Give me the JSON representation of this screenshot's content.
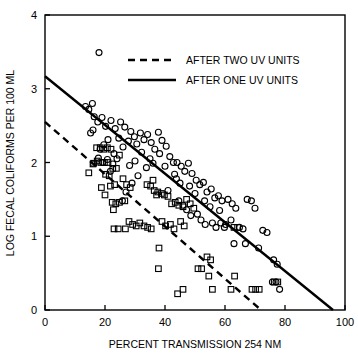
{
  "chart_data": {
    "type": "scatter",
    "title": "",
    "xlabel": "PERCENT TRANSMISSION 254 NM",
    "ylabel": "LOG FECAL COLIFORMS PER 100 ML",
    "xlim": [
      0,
      100
    ],
    "ylim": [
      0,
      4
    ],
    "xticks": [
      0,
      20,
      40,
      60,
      80,
      100
    ],
    "yticks": [
      0,
      1,
      2,
      3,
      4
    ],
    "xtick_labels": [
      "0",
      "20",
      "40",
      "60",
      "80",
      "100"
    ],
    "ytick_labels": [
      "0",
      "1",
      "2",
      "3",
      "4"
    ],
    "grid": false,
    "legend_position": "top-center",
    "series": [
      {
        "name": "AFTER ONE UV UNITS",
        "marker": "circle",
        "points": [
          [
            18.0,
            3.49
          ],
          [
            13.5,
            2.76
          ],
          [
            14.6,
            2.72
          ],
          [
            15.8,
            2.8
          ],
          [
            16.4,
            2.62
          ],
          [
            15.2,
            2.4
          ],
          [
            16.0,
            2.44
          ],
          [
            17.6,
            2.55
          ],
          [
            19.0,
            2.61
          ],
          [
            20.2,
            2.49
          ],
          [
            21.0,
            2.31
          ],
          [
            19.6,
            2.24
          ],
          [
            18.4,
            2.18
          ],
          [
            22.0,
            2.57
          ],
          [
            23.4,
            2.46
          ],
          [
            24.6,
            2.33
          ],
          [
            23.0,
            2.12
          ],
          [
            25.2,
            2.55
          ],
          [
            26.6,
            2.48
          ],
          [
            27.8,
            2.29
          ],
          [
            26.0,
            2.21
          ],
          [
            24.0,
            2.05
          ],
          [
            22.6,
            1.98
          ],
          [
            28.6,
            2.42
          ],
          [
            29.8,
            2.35
          ],
          [
            30.6,
            2.25
          ],
          [
            31.8,
            2.4
          ],
          [
            33.0,
            2.31
          ],
          [
            32.2,
            2.14
          ],
          [
            30.0,
            2.02
          ],
          [
            28.2,
            1.96
          ],
          [
            34.2,
            2.38
          ],
          [
            35.4,
            2.27
          ],
          [
            36.6,
            2.18
          ],
          [
            35.0,
            2.05
          ],
          [
            33.8,
            1.93
          ],
          [
            37.8,
            2.41
          ],
          [
            39.0,
            2.3
          ],
          [
            38.2,
            2.12
          ],
          [
            36.0,
            1.99
          ],
          [
            40.4,
            2.22
          ],
          [
            41.6,
            2.08
          ],
          [
            40.0,
            1.95
          ],
          [
            42.8,
            2.0
          ],
          [
            44.0,
            2.0
          ],
          [
            43.2,
            1.84
          ],
          [
            45.4,
            1.95
          ],
          [
            46.6,
            1.88
          ],
          [
            45.0,
            1.72
          ],
          [
            47.8,
            1.99
          ],
          [
            49.0,
            1.85
          ],
          [
            48.2,
            1.68
          ],
          [
            50.4,
            1.76
          ],
          [
            51.6,
            1.7
          ],
          [
            50.0,
            1.58
          ],
          [
            52.8,
            1.73
          ],
          [
            54.0,
            1.6
          ],
          [
            53.2,
            1.48
          ],
          [
            55.4,
            1.64
          ],
          [
            56.6,
            1.52
          ],
          [
            55.0,
            1.4
          ],
          [
            57.8,
            1.55
          ],
          [
            59.0,
            1.48
          ],
          [
            58.2,
            1.35
          ],
          [
            61.0,
            1.5
          ],
          [
            62.4,
            1.44
          ],
          [
            63.6,
            1.38
          ],
          [
            62.0,
            1.22
          ],
          [
            60.2,
            1.16
          ],
          [
            44.6,
            1.48
          ],
          [
            46.0,
            1.42
          ],
          [
            47.2,
            1.36
          ],
          [
            48.6,
            1.28
          ],
          [
            50.8,
            1.3
          ],
          [
            52.0,
            1.22
          ],
          [
            53.4,
            1.16
          ],
          [
            55.8,
            1.18
          ],
          [
            57.0,
            1.12
          ],
          [
            58.6,
            1.18
          ],
          [
            59.8,
            1.12
          ],
          [
            64.8,
            1.12
          ],
          [
            66.0,
            1.1
          ],
          [
            67.4,
            1.5
          ],
          [
            68.8,
            1.48
          ],
          [
            70.0,
            1.38
          ],
          [
            66.8,
            0.9
          ],
          [
            63.0,
            0.9
          ],
          [
            71.2,
            0.84
          ],
          [
            72.6,
            1.08
          ],
          [
            74.0,
            1.05
          ],
          [
            76.2,
            0.68
          ],
          [
            77.4,
            0.62
          ],
          [
            75.8,
            0.38
          ],
          [
            77.0,
            0.38
          ],
          [
            78.2,
            0.28
          ],
          [
            41.0,
            1.62
          ],
          [
            43.8,
            1.78
          ],
          [
            31.0,
            1.82
          ],
          [
            29.0,
            1.72
          ],
          [
            27.0,
            1.6
          ],
          [
            25.8,
            1.48
          ],
          [
            21.8,
            1.88
          ],
          [
            20.8,
            2.04
          ],
          [
            19.2,
            2.0
          ],
          [
            17.8,
            2.06
          ]
        ]
      },
      {
        "name": "AFTER TWO UV UNITS",
        "marker": "square",
        "points": [
          [
            14.6,
            1.86
          ],
          [
            16.0,
            1.98
          ],
          [
            17.2,
            2.2
          ],
          [
            18.4,
            2.2
          ],
          [
            19.6,
            2.18
          ],
          [
            20.8,
            2.2
          ],
          [
            22.0,
            2.18
          ],
          [
            21.0,
            2.0
          ],
          [
            19.8,
            2.0
          ],
          [
            18.6,
            2.0
          ],
          [
            17.4,
            2.02
          ],
          [
            16.2,
            1.99
          ],
          [
            20.2,
            1.84
          ],
          [
            21.4,
            1.82
          ],
          [
            22.6,
            1.92
          ],
          [
            23.8,
            1.92
          ],
          [
            24.8,
            2.1
          ],
          [
            23.2,
            1.7
          ],
          [
            21.8,
            1.68
          ],
          [
            20.0,
            1.56
          ],
          [
            18.8,
            1.66
          ],
          [
            22.4,
            1.46
          ],
          [
            23.6,
            1.44
          ],
          [
            24.8,
            1.46
          ],
          [
            22.8,
            1.36
          ],
          [
            26.0,
            1.78
          ],
          [
            27.2,
            1.7
          ],
          [
            28.4,
            1.66
          ],
          [
            26.6,
            1.48
          ],
          [
            28.0,
            1.2
          ],
          [
            29.2,
            1.16
          ],
          [
            30.4,
            1.14
          ],
          [
            23.0,
            1.1
          ],
          [
            24.4,
            1.1
          ],
          [
            26.8,
            1.1
          ],
          [
            31.6,
            1.18
          ],
          [
            33.0,
            1.14
          ],
          [
            34.2,
            1.12
          ],
          [
            35.4,
            1.1
          ],
          [
            34.0,
            1.7
          ],
          [
            35.2,
            1.68
          ],
          [
            36.4,
            1.62
          ],
          [
            37.6,
            1.6
          ],
          [
            38.8,
            1.58
          ],
          [
            36.0,
            1.76
          ],
          [
            37.2,
            1.56
          ],
          [
            39.8,
            1.56
          ],
          [
            41.0,
            1.54
          ],
          [
            42.2,
            1.44
          ],
          [
            43.4,
            1.46
          ],
          [
            44.6,
            1.42
          ],
          [
            46.0,
            1.4
          ],
          [
            47.2,
            1.5
          ],
          [
            48.4,
            1.44
          ],
          [
            49.6,
            1.38
          ],
          [
            45.2,
            1.2
          ],
          [
            46.4,
            1.14
          ],
          [
            41.8,
            1.16
          ],
          [
            43.0,
            1.1
          ],
          [
            39.0,
            1.2
          ],
          [
            40.2,
            1.14
          ],
          [
            38.0,
            0.84
          ],
          [
            37.8,
            0.56
          ],
          [
            44.2,
            0.22
          ],
          [
            46.0,
            0.28
          ],
          [
            51.0,
            0.56
          ],
          [
            52.2,
            0.56
          ],
          [
            54.0,
            0.72
          ],
          [
            55.2,
            0.68
          ],
          [
            54.6,
            0.46
          ],
          [
            55.8,
            0.28
          ],
          [
            62.0,
            0.28
          ],
          [
            63.2,
            0.46
          ],
          [
            69.0,
            0.28
          ],
          [
            70.2,
            0.28
          ],
          [
            71.4,
            0.28
          ],
          [
            76.4,
            0.38
          ],
          [
            77.6,
            0.38
          ],
          [
            63.0,
            1.12
          ],
          [
            64.2,
            1.12
          ]
        ]
      }
    ],
    "fit_lines": [
      {
        "name": "AFTER ONE UV UNITS",
        "style": "solid",
        "x_start": 0,
        "y_start": 3.17,
        "x_end": 96,
        "y_end": 0.0
      },
      {
        "name": "AFTER TWO UV UNITS",
        "style": "dashed",
        "x_start": 0,
        "y_start": 2.55,
        "x_end": 72,
        "y_end": 0.0
      }
    ]
  },
  "legend": {
    "entries": [
      {
        "label": "AFTER TWO UV UNITS",
        "style": "dashed"
      },
      {
        "label": "AFTER ONE UV UNITS",
        "style": "solid"
      }
    ]
  }
}
